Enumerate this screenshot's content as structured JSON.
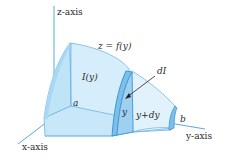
{
  "diagram": {
    "labels": {
      "z_axis": "z-axis",
      "x_axis": "x-axis",
      "y_axis": "y-axis",
      "surface": "z = f(y)",
      "cross_section": "I(y)",
      "slice": "dI",
      "y": "y",
      "y_plus_dy": "y+dy",
      "a": "a",
      "b": "b"
    },
    "colors": {
      "axis": "#5aaad8",
      "face_light": "#d6eefb",
      "face_mid": "#bfe3f7",
      "face_side": "#a9d8f3",
      "slice_fill": "#7cc0ea",
      "slice_edge": "#3d97d6",
      "edge": "#6fb6e4",
      "text": "#2b2b2b",
      "arrow": "#222222"
    }
  }
}
